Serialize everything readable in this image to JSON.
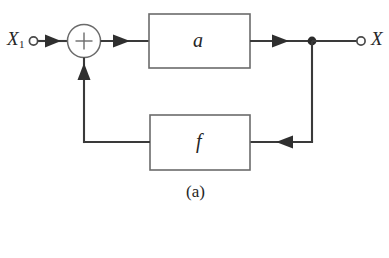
{
  "figure": {
    "caption": "(a)",
    "background_color": "#ffffff",
    "line_color": "#3a3a3a",
    "block_border_color": "#6b6b6b",
    "text_color": "#262626"
  },
  "terminals": {
    "input": {
      "label": "X",
      "subscript": "1",
      "icon": "open-circle-terminal"
    },
    "output": {
      "label": "X",
      "subscript": "",
      "icon": "open-circle-terminal"
    }
  },
  "summing_junction": {
    "sign": "+",
    "shape": "circle"
  },
  "blocks": [
    {
      "id": "forward-gain",
      "label": "a",
      "role": "forward path gain"
    },
    {
      "id": "feedback-gain",
      "label": "f",
      "role": "feedback path gain"
    }
  ],
  "nodes": [
    {
      "id": "output-takeoff",
      "icon": "filled-dot"
    }
  ],
  "signal_flow": [
    {
      "from": "input-terminal",
      "to": "summing-junction",
      "direction": "right"
    },
    {
      "from": "summing-junction",
      "to": "forward-gain",
      "direction": "right"
    },
    {
      "from": "forward-gain",
      "to": "output-takeoff",
      "direction": "right"
    },
    {
      "from": "output-takeoff",
      "to": "output-terminal",
      "direction": "right"
    },
    {
      "from": "output-takeoff",
      "to": "feedback-gain",
      "direction": "left"
    },
    {
      "from": "feedback-gain",
      "to": "summing-junction",
      "direction": "up"
    }
  ]
}
